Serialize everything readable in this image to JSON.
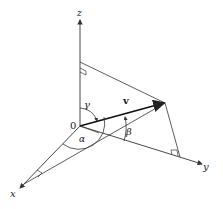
{
  "diagram": {
    "type": "3d-vector-direction-angles",
    "axes": {
      "x_label": "x",
      "y_label": "y",
      "z_label": "z",
      "origin_label": "0"
    },
    "vector": {
      "label": "v"
    },
    "angles": {
      "alpha": "α",
      "beta": "β",
      "gamma": "γ"
    },
    "colors": {
      "line": "#333333",
      "background": "#ffffff"
    }
  }
}
